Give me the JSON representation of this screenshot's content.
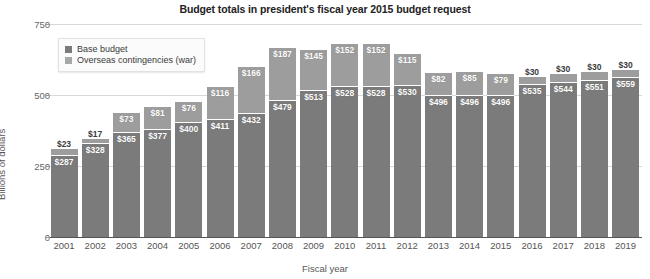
{
  "chart_data": {
    "type": "bar",
    "subtype": "stacked",
    "title": "Budget totals in president's fiscal year 2015 budget request",
    "xlabel": "Fiscal year",
    "ylabel": "Billions of dollars",
    "ylim": [
      0,
      750
    ],
    "yticks": [
      0,
      250,
      500,
      750
    ],
    "ytick_labels": [
      "0",
      "250",
      "500",
      "750"
    ],
    "grid": true,
    "legend_position": "top-left-inside",
    "categories": [
      "2001",
      "2002",
      "2003",
      "2004",
      "2005",
      "2006",
      "2007",
      "2008",
      "2009",
      "2010",
      "2011",
      "2012",
      "2013",
      "2014",
      "2015",
      "2016",
      "2017",
      "2018",
      "2019"
    ],
    "series": [
      {
        "name": "Base budget",
        "color": "#7b7b7b",
        "values": [
          287,
          328,
          365,
          377,
          400,
          411,
          432,
          479,
          513,
          528,
          528,
          530,
          496,
          496,
          496,
          535,
          544,
          551,
          559
        ],
        "labels": [
          "$287",
          "$328",
          "$365",
          "$377",
          "$400",
          "$411",
          "$432",
          "$479",
          "$513",
          "$528",
          "$528",
          "$530",
          "$496",
          "$496",
          "$496",
          "$535",
          "$544",
          "$551",
          "$559"
        ]
      },
      {
        "name": "Overseas contingencies (war)",
        "color": "#9d9d9d",
        "values": [
          23,
          17,
          73,
          81,
          76,
          116,
          166,
          187,
          145,
          152,
          152,
          115,
          82,
          85,
          79,
          30,
          30,
          30,
          30
        ],
        "labels": [
          "$23",
          "$17",
          "$73",
          "$81",
          "$76",
          "$116",
          "$166",
          "$187",
          "$145",
          "$152",
          "$152",
          "$115",
          "$82",
          "$85",
          "$79",
          "$30",
          "$30",
          "$30",
          "$30"
        ],
        "label_outside": [
          true,
          true,
          false,
          false,
          false,
          false,
          false,
          false,
          false,
          false,
          false,
          false,
          false,
          false,
          false,
          true,
          true,
          true,
          true
        ]
      }
    ],
    "totals": [
      310,
      345,
      438,
      458,
      476,
      527,
      598,
      666,
      658,
      680,
      680,
      645,
      578,
      581,
      575,
      565,
      574,
      581,
      589
    ]
  },
  "legend": {
    "items": [
      {
        "label": "Base budget",
        "color": "#7b7b7b"
      },
      {
        "label": "Overseas contingencies (war)",
        "color": "#a8a8a8"
      }
    ]
  }
}
